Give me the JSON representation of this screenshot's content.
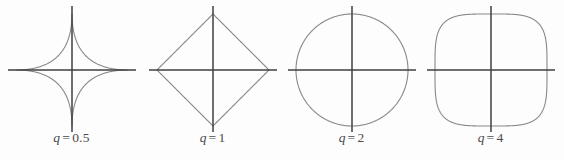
{
  "figure": {
    "background_color": "#fdfdfd",
    "curve_color": "#888888",
    "axis_color": "#3f3f3f",
    "label_color": "#4a4a4a",
    "width": 564,
    "height": 160
  },
  "chart_data": {
    "type": "line",
    "title": "",
    "subtitle": "",
    "xlabel": "",
    "ylabel": "",
    "grid": false,
    "legend_position": "none",
    "equation": "|x|^q + |y|^q = 1",
    "xlim": [
      -1.18,
      1.18
    ],
    "ylim": [
      -1.18,
      1.18
    ],
    "panels": [
      {
        "index": 0,
        "label_var": "q",
        "label_op": "=",
        "label_value": "0.5",
        "q": 0.5,
        "shape": "astroid",
        "description": "four-pointed concave star",
        "center_x": 72,
        "center_y": 70,
        "radius_px": 56,
        "axis_half_len": 64,
        "vertices": [
          [
            1,
            0
          ],
          [
            0,
            1
          ],
          [
            -1,
            0
          ],
          [
            0,
            -1
          ]
        ],
        "sample_points": [
          [
            1.0,
            0.0
          ],
          [
            0.9,
            0.0025
          ],
          [
            0.75,
            0.0179
          ],
          [
            0.6,
            0.0503
          ],
          [
            0.5,
            0.0858
          ],
          [
            0.4,
            0.1351
          ],
          [
            0.25,
            0.25
          ],
          [
            0.1351,
            0.4
          ],
          [
            0.0858,
            0.5
          ],
          [
            0.0503,
            0.6
          ],
          [
            0.0179,
            0.75
          ],
          [
            0.0025,
            0.9
          ],
          [
            0.0,
            1.0
          ]
        ]
      },
      {
        "index": 1,
        "label_var": "q",
        "label_op": "=",
        "label_value": "1",
        "q": 1,
        "shape": "diamond",
        "description": "square rotated 45 degrees",
        "center_x": 213,
        "center_y": 70,
        "radius_px": 56,
        "axis_half_len": 64,
        "vertices": [
          [
            1,
            0
          ],
          [
            0,
            1
          ],
          [
            -1,
            0
          ],
          [
            0,
            -1
          ]
        ],
        "sample_points": [
          [
            1.0,
            0.0
          ],
          [
            0.75,
            0.25
          ],
          [
            0.5,
            0.5
          ],
          [
            0.25,
            0.75
          ],
          [
            0.0,
            1.0
          ]
        ]
      },
      {
        "index": 2,
        "label_var": "q",
        "label_op": "=",
        "label_value": "2",
        "q": 2,
        "shape": "circle",
        "description": "unit circle",
        "center_x": 352,
        "center_y": 70,
        "radius_px": 56,
        "axis_half_len": 64,
        "vertices": [
          [
            1,
            0
          ],
          [
            0,
            1
          ],
          [
            -1,
            0
          ],
          [
            0,
            -1
          ]
        ],
        "sample_points": [
          [
            1.0,
            0.0
          ],
          [
            0.966,
            0.259
          ],
          [
            0.866,
            0.5
          ],
          [
            0.707,
            0.707
          ],
          [
            0.5,
            0.866
          ],
          [
            0.259,
            0.966
          ],
          [
            0.0,
            1.0
          ]
        ]
      },
      {
        "index": 3,
        "label_var": "q",
        "label_op": "=",
        "label_value": "4",
        "q": 4,
        "shape": "squircle",
        "description": "rounded square",
        "center_x": 490,
        "center_y": 70,
        "radius_px": 56,
        "axis_half_len": 64,
        "vertices": [
          [
            1,
            0
          ],
          [
            0,
            1
          ],
          [
            -1,
            0
          ],
          [
            0,
            -1
          ]
        ],
        "sample_points": [
          [
            1.0,
            0.0
          ],
          [
            0.99,
            0.444
          ],
          [
            0.97,
            0.575
          ],
          [
            0.93,
            0.697
          ],
          [
            0.841,
            0.841
          ],
          [
            0.697,
            0.93
          ],
          [
            0.575,
            0.97
          ],
          [
            0.444,
            0.99
          ],
          [
            0.0,
            1.0
          ]
        ]
      }
    ]
  }
}
